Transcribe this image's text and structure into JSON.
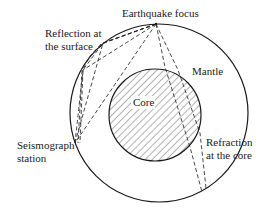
{
  "diagram": {
    "labels": {
      "focus": "Earthquake focus",
      "reflection_line1": "Reflection at",
      "reflection_line2": "the surface",
      "mantle": "Mantle",
      "core": "Core",
      "station_line1": "Seismograph",
      "station_line2": "station",
      "refraction_line1": "Refraction",
      "refraction_line2": "at the core"
    },
    "colors": {
      "stroke": "#1a1a1a",
      "background": "#ffffff",
      "hatch": "#555555"
    },
    "geometry": {
      "outer_circle": {
        "cx": 159,
        "cy": 113,
        "r": 89
      },
      "core_circle": {
        "cx": 155,
        "cy": 115,
        "r": 46
      },
      "focus_point": [
        156,
        24
      ],
      "station_point": [
        75,
        143
      ]
    },
    "rays": [
      {
        "name": "direct",
        "points": [
          [
            156,
            24
          ],
          [
            75,
            143
          ]
        ]
      },
      {
        "name": "one-reflection",
        "points": [
          [
            156,
            24
          ],
          [
            103,
            43
          ],
          [
            75,
            143
          ]
        ]
      },
      {
        "name": "two-reflection",
        "points": [
          [
            156,
            24
          ],
          [
            83,
            70
          ],
          [
            75,
            143
          ]
        ]
      },
      {
        "name": "multi-reflection",
        "points": [
          [
            156,
            24
          ],
          [
            103,
            43
          ],
          [
            83,
            70
          ],
          [
            75,
            143
          ]
        ]
      },
      {
        "name": "core-refraction-1",
        "points": [
          [
            156,
            24
          ],
          [
            165,
            67
          ],
          [
            190,
            147
          ],
          [
            202,
            192
          ]
        ]
      },
      {
        "name": "core-refraction-2",
        "points": [
          [
            156,
            24
          ],
          [
            178,
            70
          ],
          [
            200,
            133
          ],
          [
            206,
            188
          ]
        ]
      }
    ]
  }
}
